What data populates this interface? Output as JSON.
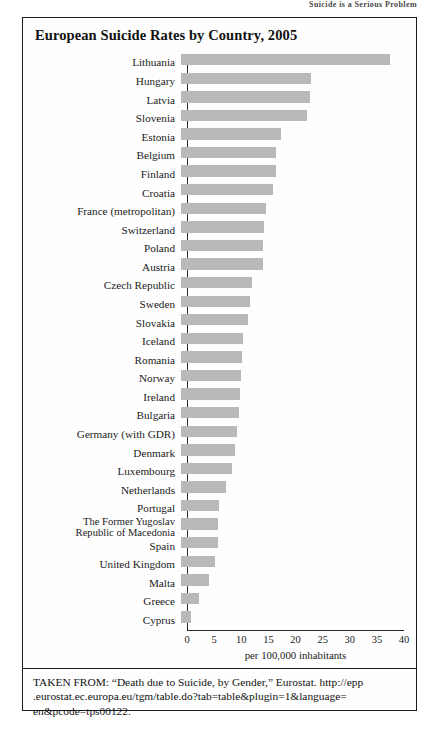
{
  "page_header": {
    "text": "Suicide is a Serious Problem"
  },
  "figure": {
    "title": "European Suicide Rates by Country, 2005",
    "source_note": "TAKEN FROM: “Death due to Suicide, by Gender,” Eurostat. http://epp .eurostat.ec.europa.eu/tgm/table.do?tab=table&plugin=1&language= en&pcode=tps00122."
  },
  "chart_data": {
    "type": "bar",
    "orientation": "horizontal",
    "title": "European Suicide Rates by Country, 2005",
    "xlabel": "per 100,000 inhabitants",
    "ylabel": "",
    "xlim": [
      0,
      40
    ],
    "xticks": [
      0,
      5,
      10,
      15,
      20,
      25,
      30,
      35,
      40
    ],
    "grid": false,
    "legend": null,
    "bar_color": "#b9b9b9",
    "categories": [
      "Lithuania",
      "Hungary",
      "Latvia",
      "Slovenia",
      "Estonia",
      "Belgium",
      "Finland",
      "Croatia",
      "France (metropolitan)",
      "Switzerland",
      "Poland",
      "Austria",
      "Czech Republic",
      "Sweden",
      "Slovakia",
      "Iceland",
      "Romania",
      "Norway",
      "Ireland",
      "Bulgaria",
      "Germany (with GDR)",
      "Denmark",
      "Luxembourg",
      "Netherlands",
      "Portugal",
      "The Former Yugoslav\nRepublic of Macedonia",
      "Spain",
      "United Kingdom",
      "Malta",
      "Greece",
      "Cyprus"
    ],
    "values": [
      38.6,
      24.0,
      23.7,
      23.2,
      18.4,
      17.6,
      17.5,
      17.0,
      15.7,
      15.3,
      15.2,
      15.1,
      13.0,
      12.7,
      12.3,
      11.5,
      11.3,
      11.1,
      10.8,
      10.6,
      10.4,
      9.9,
      9.4,
      8.3,
      7.0,
      6.9,
      6.8,
      6.2,
      5.2,
      3.3,
      1.8
    ]
  },
  "axis": {
    "tick_labels": [
      "0",
      "5",
      "10",
      "15",
      "20",
      "25",
      "30",
      "35",
      "40"
    ]
  }
}
